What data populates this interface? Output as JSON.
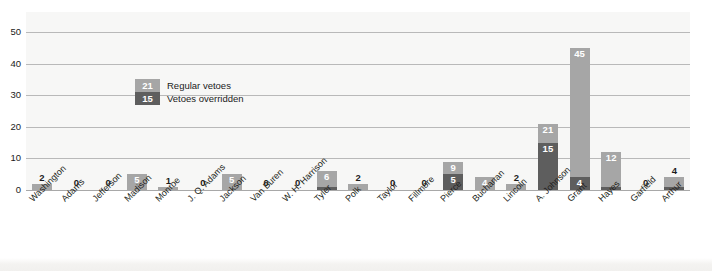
{
  "chart_data": {
    "type": "bar",
    "title": "",
    "xlabel": "",
    "ylabel": "",
    "ylim": [
      0,
      50
    ],
    "yticks": [
      0,
      10,
      20,
      30,
      40,
      50
    ],
    "grid": true,
    "legend_position": "inside-upper-left",
    "stacked": true,
    "categories": [
      "Washington",
      "Adams",
      "Jefferson",
      "Madison",
      "Monroe",
      "J. Q. Adams",
      "Jackson",
      "Van Buren",
      "W. H. Harrison",
      "Tyler",
      "Polk",
      "Taylor",
      "Fillmore",
      "Pierce",
      "Buchanan",
      "Lincoln",
      "A. Johnson",
      "Grant",
      "Hayes",
      "Garfield",
      "Arthur"
    ],
    "series": [
      {
        "name": "Regular vetoes",
        "color": "#a6a6a6",
        "values": [
          2,
          0,
          0,
          5,
          1,
          0,
          5,
          0,
          0,
          6,
          2,
          0,
          0,
          9,
          4,
          2,
          21,
          45,
          12,
          0,
          4
        ]
      },
      {
        "name": "Vetoes overridden",
        "color": "#5e5e5e",
        "values": [
          0,
          0,
          0,
          0,
          0,
          0,
          0,
          0,
          0,
          1,
          0,
          0,
          0,
          5,
          0,
          0,
          15,
          4,
          1,
          0,
          1
        ]
      }
    ]
  },
  "legend": {
    "items": [
      {
        "swatch_value": "21",
        "label": "Regular vetoes",
        "color": "#a6a6a6"
      },
      {
        "swatch_value": "15",
        "label": "Vetoes overridden",
        "color": "#5e5e5e"
      }
    ]
  },
  "axis": {
    "y_tick_labels": [
      "0",
      "10",
      "20",
      "30",
      "40",
      "50"
    ]
  }
}
